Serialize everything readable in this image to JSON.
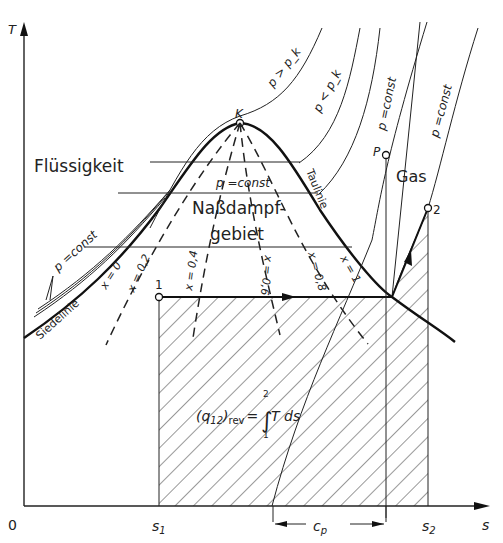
{
  "diagram": {
    "type": "T-s diagram (wet steam region)",
    "axes": {
      "y_label": "T",
      "x_label": "s",
      "origin_label": "0",
      "x_ticks": [
        {
          "label_base": "s",
          "label_sub": "1"
        },
        {
          "label_base": "s",
          "label_sub": "2"
        }
      ]
    },
    "regions": {
      "liquid": "Flüssigkeit",
      "wet_steam_line1": "Naßdampf-",
      "wet_steam_line2": "gebiet",
      "gas": "Gas"
    },
    "curves": {
      "saturated_liquid": "Siedelinie",
      "saturated_vapor": "Taulinie",
      "critical_point": "K",
      "supercritical_isobar": "p > p_k",
      "subcritical_isobar": "p < p_k",
      "isobar_inside": "p =const",
      "isobar_liquid": "p =const",
      "isobar_gas_1": "p =const",
      "isobar_gas_2": "p =const"
    },
    "quality_lines": [
      "x = 0",
      "x = 0,2",
      "x = 0,4",
      "x = 0,6",
      "x = 0,8",
      "x = 1"
    ],
    "points": {
      "p1": "1",
      "p2": "2",
      "P": "P"
    },
    "annotations": {
      "heat_lhs_base": "(q",
      "heat_lhs_sub": "12",
      "heat_lhs_close": ")",
      "heat_lhs_rev": "rev",
      "heat_eq": "=",
      "integral_upper": "2",
      "integral_lower": "1",
      "integrand": "T ds",
      "cp_base": "c",
      "cp_sub": "p"
    },
    "colors": {
      "ink": "#222222",
      "background": "#ffffff"
    }
  }
}
